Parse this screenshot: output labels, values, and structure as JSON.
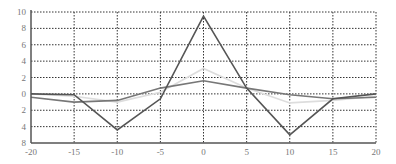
{
  "chart_data": {
    "type": "line",
    "title": "",
    "xlabel": "",
    "ylabel": "",
    "x": [
      -20,
      -15,
      -10,
      -5,
      0,
      5,
      10,
      15,
      20
    ],
    "xlim": [
      -20,
      20
    ],
    "ylim": [
      -6,
      10
    ],
    "grid": true,
    "legend": "none",
    "x_ticks": [
      -20,
      -15,
      -10,
      -5,
      0,
      5,
      10,
      15,
      20
    ],
    "x_tick_labels": [
      "-20",
      "-15",
      "-10",
      "-5",
      "0",
      "5",
      "10",
      "15",
      "20"
    ],
    "y_ticks": [
      10,
      8,
      6,
      4,
      2,
      0,
      -2,
      -4,
      -6
    ],
    "y_tick_labels": [
      "10",
      "8",
      "6",
      "4",
      "2",
      "0",
      "2",
      "4",
      "8"
    ],
    "series": [
      {
        "name": "series-light",
        "color": "#dddddd",
        "values": [
          0.0,
          -0.3,
          -1.0,
          0.2,
          3.1,
          0.7,
          -1.1,
          -0.8,
          -0.3
        ]
      },
      {
        "name": "series-mid",
        "color": "#777777",
        "values": [
          -0.4,
          -1.0,
          -0.8,
          0.7,
          1.6,
          0.7,
          -0.1,
          -0.6,
          -0.4
        ]
      },
      {
        "name": "series-dark",
        "color": "#555555",
        "values": [
          0.0,
          -0.1,
          -4.4,
          -0.6,
          9.5,
          0.7,
          -5.0,
          -0.6,
          0.0
        ]
      }
    ]
  }
}
